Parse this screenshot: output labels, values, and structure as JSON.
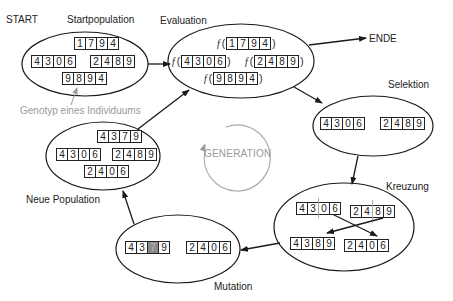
{
  "labels": {
    "start": "START",
    "startpopulation": "Startpopulation",
    "evaluation": "Evaluation",
    "ende": "ENDE",
    "selektion": "Selektion",
    "kreuzung": "Kreuzung",
    "mutation": "Mutation",
    "neue_population": "Neue Population",
    "genotyp_hint": "Genotyp eines Individuums",
    "generation": "GENERATION",
    "f_symbol": "f",
    "paren_open": "(",
    "paren_close": ")"
  },
  "startpopulation": {
    "genotypes": [
      [
        "1",
        "7",
        "9",
        "4"
      ],
      [
        "4",
        "3",
        "0",
        "6"
      ],
      [
        "2",
        "4",
        "8",
        "9"
      ],
      [
        "9",
        "8",
        "9",
        "4"
      ]
    ]
  },
  "evaluation": {
    "genotypes": [
      [
        "1",
        "7",
        "9",
        "4"
      ],
      [
        "4",
        "3",
        "0",
        "6"
      ],
      [
        "2",
        "4",
        "8",
        "9"
      ],
      [
        "9",
        "8",
        "9",
        "4"
      ]
    ]
  },
  "selektion": {
    "genotypes": [
      [
        "4",
        "3",
        "0",
        "6"
      ],
      [
        "2",
        "4",
        "8",
        "9"
      ]
    ]
  },
  "kreuzung": {
    "parents": [
      [
        "4",
        "3",
        "0",
        "6"
      ],
      [
        "2",
        "4",
        "8",
        "9"
      ]
    ],
    "children": [
      [
        "4",
        "3",
        "8",
        "9"
      ],
      [
        "2",
        "4",
        "0",
        "6"
      ]
    ]
  },
  "mutation": {
    "genotypes": [
      [
        "4",
        "3",
        "7",
        "9"
      ],
      [
        "2",
        "4",
        "0",
        "6"
      ]
    ],
    "mutated_index": 2
  },
  "neue_population": {
    "genotypes": [
      [
        "4",
        "3",
        "7",
        "9"
      ],
      [
        "4",
        "3",
        "0",
        "6"
      ],
      [
        "2",
        "4",
        "8",
        "9"
      ],
      [
        "2",
        "4",
        "0",
        "6"
      ]
    ]
  },
  "colors": {
    "stroke": "#1a1a1a",
    "hint_gray": "#9a9a9a",
    "mutated_cell": "#8a8a8a"
  }
}
